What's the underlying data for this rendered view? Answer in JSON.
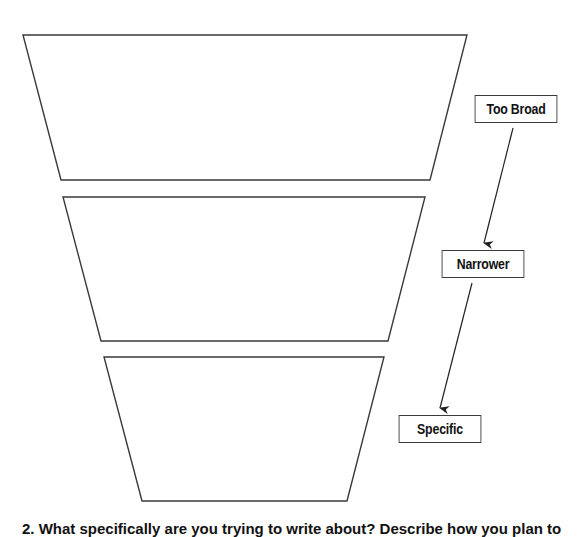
{
  "diagram": {
    "stroke_color": "#3a3a3a",
    "funnel_levels": [
      {
        "id": "level-1",
        "points": "23,35 467,35 430,180 61,180"
      },
      {
        "id": "level-2",
        "points": "63,197 425,197 388,341 101,341"
      },
      {
        "id": "level-3",
        "points": "104,357 384,357 347,501 142,501"
      }
    ],
    "labels": [
      {
        "id": "too-broad",
        "text": "Too Broad"
      },
      {
        "id": "narrower",
        "text": "Narrower"
      },
      {
        "id": "specific",
        "text": "Specific"
      }
    ],
    "arrows": [
      {
        "from": "too-broad",
        "to": "narrower"
      },
      {
        "from": "narrower",
        "to": "specific"
      }
    ]
  },
  "question": {
    "text": "2. What specifically are you trying to write about? Describe how you plan to"
  }
}
